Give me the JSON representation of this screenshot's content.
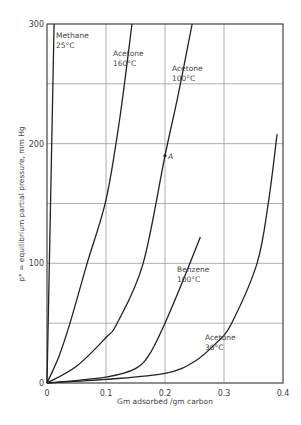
{
  "chart_data": {
    "type": "line",
    "title": "",
    "xlabel": "Gm adsorbed /gm carbon",
    "ylabel": "p* = equilibrium partial pressure, mm Hg",
    "xlim": [
      0,
      0.4
    ],
    "ylim": [
      0,
      300
    ],
    "x_ticks": [
      "0",
      "0.1",
      "0.2",
      "0.3",
      "0.4"
    ],
    "y_ticks": [
      "0",
      "100",
      "200",
      "300"
    ],
    "grid": true,
    "legend": "inline labels",
    "series": [
      {
        "name": "Methane 25°C",
        "label_lines": [
          "Methane",
          "25°C"
        ],
        "points": [
          [
            0,
            0
          ],
          [
            0.004,
            100
          ],
          [
            0.008,
            200
          ],
          [
            0.012,
            300
          ]
        ]
      },
      {
        "name": "Acetone 160°C",
        "label_lines": [
          "Acetone",
          "160°C"
        ],
        "points": [
          [
            0,
            0
          ],
          [
            0.02,
            22
          ],
          [
            0.039,
            50
          ],
          [
            0.068,
            100
          ],
          [
            0.1,
            153
          ],
          [
            0.123,
            220
          ],
          [
            0.144,
            300
          ]
        ]
      },
      {
        "name": "Acetone 100°C",
        "label_lines": [
          "Acetone",
          "100°C"
        ],
        "points": [
          [
            0,
            0
          ],
          [
            0.05,
            14
          ],
          [
            0.1,
            38
          ],
          [
            0.119,
            50
          ],
          [
            0.163,
            100
          ],
          [
            0.2,
            190
          ],
          [
            0.222,
            240
          ],
          [
            0.246,
            300
          ]
        ]
      },
      {
        "name": "Benzene 100°C",
        "label_lines": [
          "Benzene",
          "100°C"
        ],
        "points": [
          [
            0,
            0
          ],
          [
            0.1,
            5
          ],
          [
            0.15,
            12
          ],
          [
            0.175,
            25
          ],
          [
            0.2,
            50
          ],
          [
            0.23,
            85
          ],
          [
            0.26,
            122
          ]
        ]
      },
      {
        "name": "Acetone 30°C",
        "label_lines": [
          "Acetone",
          "30°C"
        ],
        "points": [
          [
            0,
            0
          ],
          [
            0.1,
            3
          ],
          [
            0.2,
            8
          ],
          [
            0.25,
            18
          ],
          [
            0.29,
            35
          ],
          [
            0.313,
            50
          ],
          [
            0.356,
            100
          ],
          [
            0.375,
            150
          ],
          [
            0.39,
            208
          ]
        ]
      }
    ],
    "annotations": [
      {
        "text": "A",
        "x": 0.2,
        "y": 190
      }
    ]
  }
}
